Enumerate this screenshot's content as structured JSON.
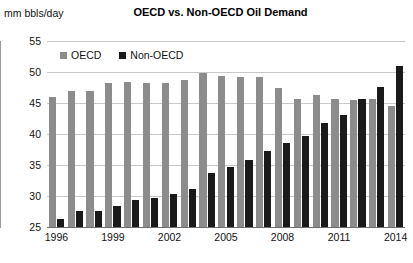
{
  "chart_data": {
    "type": "bar",
    "title": "OECD vs. Non-OECD Oil Demand",
    "xlabel": "",
    "ylabel": "mm bbls/day",
    "ylim": [
      25,
      55
    ],
    "yticks": [
      25,
      30,
      35,
      40,
      45,
      50,
      55
    ],
    "xticks": [
      "1996",
      "1999",
      "2002",
      "2005",
      "2008",
      "2011",
      "2014"
    ],
    "categories": [
      "1996",
      "1997",
      "1998",
      "1999",
      "2000",
      "2001",
      "2002",
      "2003",
      "2004",
      "2005",
      "2006",
      "2007",
      "2008",
      "2009",
      "2010",
      "2011",
      "2012",
      "2013",
      "2014"
    ],
    "grid": true,
    "legend_position": "top-left",
    "series": [
      {
        "name": "OECD",
        "color": "#8c8c8c",
        "values": [
          45.9,
          46.9,
          47.0,
          48.2,
          48.4,
          48.2,
          48.2,
          48.7,
          49.8,
          49.4,
          49.2,
          49.2,
          47.5,
          45.6,
          46.3,
          45.7,
          45.5,
          45.6,
          44.5
        ]
      },
      {
        "name": "Non-OECD",
        "color": "#1a1a1a",
        "values": [
          26.3,
          27.6,
          27.6,
          28.4,
          29.4,
          29.6,
          30.4,
          31.2,
          33.7,
          34.6,
          35.8,
          37.2,
          38.5,
          39.6,
          41.7,
          43.1,
          45.6,
          47.6,
          50.9
        ]
      }
    ]
  },
  "axis_unit_label": "mm bbls/day"
}
